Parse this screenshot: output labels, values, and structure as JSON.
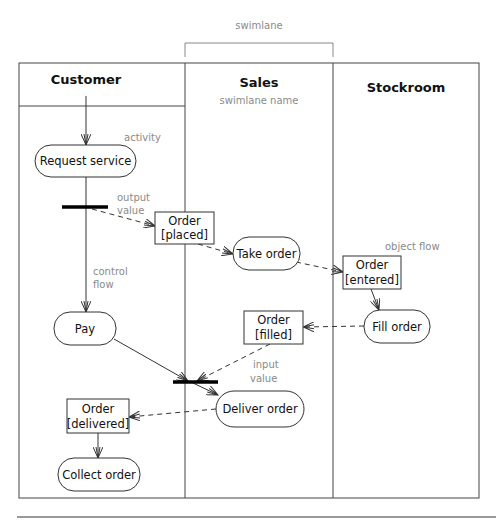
{
  "diagram": {
    "type": "UML activity diagram with swimlanes",
    "annotations": {
      "swimlane": "swimlane",
      "swimlane_name": "swimlane name",
      "activity": "activity",
      "output_value_1": "output",
      "output_value_2": "value",
      "control_flow_1": "control",
      "control_flow_2": "flow",
      "object_flow": "object flow",
      "input_value_1": "input",
      "input_value_2": "value"
    },
    "lanes": [
      {
        "id": "customer",
        "title": "Customer"
      },
      {
        "id": "sales",
        "title": "Sales"
      },
      {
        "id": "stockroom",
        "title": "Stockroom"
      }
    ],
    "activities": {
      "request_service": "Request service",
      "take_order": "Take order",
      "fill_order": "Fill order",
      "pay": "Pay",
      "deliver_order": "Deliver order",
      "collect_order": "Collect order"
    },
    "objects": {
      "placed": {
        "line1": "Order",
        "line2": "[placed]"
      },
      "entered": {
        "line1": "Order",
        "line2": "[entered]"
      },
      "filled": {
        "line1": "Order",
        "line2": "[filled]"
      },
      "delivered": {
        "line1": "Order",
        "line2": "[delivered]"
      }
    }
  }
}
